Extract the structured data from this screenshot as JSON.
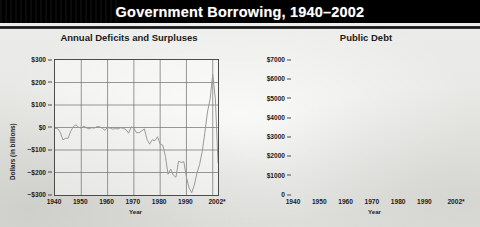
{
  "header": {
    "title": "Government Borrowing, 1940–2002"
  },
  "colors": {
    "title_band": "#000000",
    "page_background": "#e9e9e6",
    "deficit_line": "#9a9a98",
    "debt_line": "#1b1b1b",
    "grid": "#6e6e6e",
    "axis": "#4c4c4c"
  },
  "chart_data": [
    {
      "type": "line",
      "id": "annual-deficits-and-surpluses",
      "title": "Annual Deficits and Surpluses",
      "xlabel": "Year",
      "ylabel": "Dollars (in billions)",
      "grid": true,
      "legend": "none",
      "xlim": [
        1940,
        2002
      ],
      "ylim": [
        -300,
        300
      ],
      "xticks": [
        "1940",
        "1950",
        "1960",
        "1970",
        "1980",
        "1990",
        "2002*"
      ],
      "xtick_values": [
        1940,
        1950,
        1960,
        1970,
        1980,
        1990,
        2002
      ],
      "yticks": [
        "$300",
        "$200",
        "$100",
        "$0",
        "−$100",
        "−$200",
        "−$300"
      ],
      "ytick_values": [
        300,
        200,
        100,
        0,
        -100,
        -200,
        -300
      ],
      "series": [
        {
          "name": "Annual deficit / surplus",
          "color": "#9a9a98",
          "x": [
            1940,
            1941,
            1942,
            1943,
            1944,
            1945,
            1946,
            1947,
            1948,
            1949,
            1950,
            1951,
            1952,
            1953,
            1954,
            1955,
            1956,
            1957,
            1958,
            1959,
            1960,
            1961,
            1962,
            1963,
            1964,
            1965,
            1966,
            1967,
            1968,
            1969,
            1970,
            1971,
            1972,
            1973,
            1974,
            1975,
            1976,
            1977,
            1978,
            1979,
            1980,
            1981,
            1982,
            1983,
            1984,
            1985,
            1986,
            1987,
            1988,
            1989,
            1990,
            1991,
            1992,
            1993,
            1994,
            1995,
            1996,
            1997,
            1998,
            1999,
            2000,
            2001,
            2002
          ],
          "values": [
            -3,
            -5,
            -21,
            -55,
            -48,
            -48,
            -16,
            4,
            12,
            1,
            -3,
            6,
            -2,
            -6,
            -1,
            -3,
            4,
            3,
            -3,
            -13,
            0,
            -3,
            -7,
            -5,
            -6,
            -1,
            -4,
            -9,
            -25,
            3,
            -3,
            -23,
            -23,
            -15,
            -6,
            -53,
            -74,
            -54,
            -59,
            -41,
            -74,
            -79,
            -128,
            -208,
            -185,
            -212,
            -221,
            -150,
            -155,
            -152,
            -221,
            -269,
            -290,
            -255,
            -203,
            -164,
            -107,
            -22,
            69,
            126,
            236,
            127,
            -157
          ]
        }
      ]
    },
    {
      "type": "line",
      "id": "public-debt",
      "title": "Public Debt",
      "xlabel": "Year",
      "ylabel": "Dollars (in billions)",
      "grid": true,
      "legend": "none",
      "xlim": [
        1940,
        2002
      ],
      "ylim": [
        0,
        7000
      ],
      "xticks": [
        "1940",
        "1950",
        "1960",
        "1970",
        "1980",
        "1990",
        "2002*"
      ],
      "xtick_values": [
        1940,
        1950,
        1960,
        1970,
        1980,
        1990,
        2002
      ],
      "yticks": [
        "$7000",
        "$6000",
        "$5000",
        "$4000",
        "$3000",
        "$2000",
        "$1000",
        "0"
      ],
      "ytick_values": [
        7000,
        6000,
        5000,
        4000,
        3000,
        2000,
        1000,
        0
      ],
      "series": [
        {
          "name": "Public debt",
          "color": "#1b1b1b",
          "x": [
            1940,
            1941,
            1942,
            1943,
            1944,
            1945,
            1946,
            1947,
            1948,
            1949,
            1950,
            1951,
            1952,
            1953,
            1954,
            1955,
            1956,
            1957,
            1958,
            1959,
            1960,
            1961,
            1962,
            1963,
            1964,
            1965,
            1966,
            1967,
            1968,
            1969,
            1970,
            1971,
            1972,
            1973,
            1974,
            1975,
            1976,
            1977,
            1978,
            1979,
            1980,
            1981,
            1982,
            1983,
            1984,
            1985,
            1986,
            1987,
            1988,
            1989,
            1990,
            1991,
            1992,
            1993,
            1994,
            1995,
            1996,
            1997,
            1998,
            1999,
            2000,
            2001,
            2002
          ],
          "values": [
            51,
            58,
            79,
            143,
            204,
            260,
            271,
            257,
            252,
            253,
            257,
            255,
            259,
            266,
            271,
            274,
            273,
            271,
            276,
            285,
            286,
            289,
            298,
            306,
            312,
            317,
            320,
            326,
            348,
            354,
            371,
            398,
            427,
            458,
            475,
            533,
            620,
            699,
            772,
            827,
            908,
            998,
            1142,
            1377,
            1573,
            1823,
            2125,
            2350,
            2602,
            2857,
            3233,
            3665,
            4065,
            4411,
            4693,
            4974,
            5225,
            5413,
            5526,
            5656,
            5674,
            5807,
            6228
          ]
        }
      ]
    }
  ],
  "footnote_marker": "*"
}
